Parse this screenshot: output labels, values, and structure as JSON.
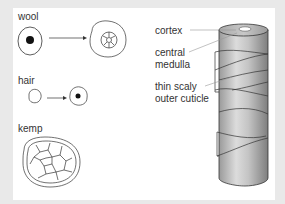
{
  "diagram": {
    "left_panel": {
      "fibre_types": [
        {
          "label": "wool",
          "description": "small round fibre with solid medulla transforms into larger fibre with segmented cortex"
        },
        {
          "label": "hair",
          "description": "small fibre transforms into fibre with solid medulla"
        },
        {
          "label": "kemp",
          "description": "large fibre with cellular cortex"
        }
      ]
    },
    "right_panel": {
      "labels": [
        {
          "text": "cortex"
        },
        {
          "text": "central\nmedulla",
          "lines": [
            "central",
            "medulla"
          ]
        },
        {
          "text": "thin scaly\nouter cuticle",
          "lines": [
            "thin scaly",
            "outer cuticle"
          ]
        }
      ]
    },
    "colors": {
      "background": "#e9e9e9",
      "panel": "#ffffff",
      "line": "#333333",
      "shaft_light": "#d6d6d6",
      "shaft_dark": "#8a8a8a"
    }
  }
}
